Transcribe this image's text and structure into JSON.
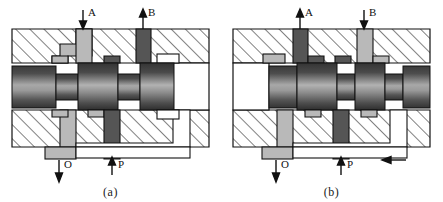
{
  "figure": {
    "panels": [
      {
        "id": "a",
        "caption": "(a)",
        "spool_position": "left",
        "spool_shift_direction": "",
        "ports": [
          {
            "name": "A",
            "label": "A",
            "flow": "in",
            "arrow": "down",
            "state": "vented",
            "fill": "#b9b9b9"
          },
          {
            "name": "B",
            "label": "B",
            "flow": "out",
            "arrow": "up",
            "state": "pressurized",
            "fill": "#555555"
          },
          {
            "name": "O",
            "label": "O",
            "flow": "out",
            "arrow": "down",
            "state": "drain",
            "fill": "#b9b9b9"
          },
          {
            "name": "P",
            "label": "P",
            "flow": "in",
            "arrow": "up",
            "state": "pressurized",
            "fill": "#555555"
          }
        ]
      },
      {
        "id": "b",
        "caption": "(b)",
        "spool_position": "right",
        "spool_shift_direction": "left",
        "ports": [
          {
            "name": "A",
            "label": "A",
            "flow": "out",
            "arrow": "up",
            "state": "pressurized",
            "fill": "#555555"
          },
          {
            "name": "B",
            "label": "B",
            "flow": "in",
            "arrow": "down",
            "state": "vented",
            "fill": "#b9b9b9"
          },
          {
            "name": "O",
            "label": "O",
            "flow": "out",
            "arrow": "down",
            "state": "drain",
            "fill": "#b9b9b9"
          },
          {
            "name": "P",
            "label": "P",
            "flow": "in",
            "arrow": "up",
            "state": "pressurized",
            "fill": "#555555"
          }
        ]
      }
    ],
    "colors": {
      "body_hatch": "#1a1a1a",
      "body_fill": "#ffffff",
      "spool_dark": "#3d3d3d",
      "spool_light": "#b0b0b0",
      "channel_pressure": "#555555",
      "channel_vent": "#b9b9b9",
      "cavity": "#ffffff",
      "outline": "#111111",
      "background": "#ffffff"
    }
  }
}
